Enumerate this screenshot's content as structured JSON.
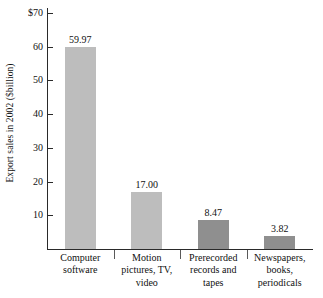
{
  "chart_data": {
    "type": "bar",
    "title": "",
    "xlabel": "",
    "ylabel": "Export sales in 2002 ($billion)",
    "categories": [
      "Computer software",
      "Motion pictures, TV, video",
      "Prerecorded records and tapes",
      "Newspapers, books, periodicals"
    ],
    "values": [
      59.97,
      17.0,
      8.47,
      3.82
    ],
    "value_labels": [
      "59.97",
      "17.00",
      "8.47",
      "3.82"
    ],
    "ylim": [
      0,
      70
    ],
    "ytick_values": [
      10,
      20,
      30,
      40,
      50,
      60,
      70
    ],
    "ytick_labels": [
      "10",
      "20",
      "30",
      "40",
      "50",
      "60",
      "$70"
    ],
    "grid": false,
    "legend": null,
    "bar_colors": [
      "#bdbdbd",
      "#bdbdbd",
      "#8f8f8f",
      "#8f8f8f"
    ]
  },
  "axis": {
    "line_color": "#2a2a2a"
  },
  "category_lines": [
    [
      "Computer",
      "software"
    ],
    [
      "Motion",
      "pictures, TV,",
      "video"
    ],
    [
      "Prerecorded",
      "records and",
      "tapes"
    ],
    [
      "Newspapers,",
      "books,",
      "periodicals"
    ]
  ]
}
